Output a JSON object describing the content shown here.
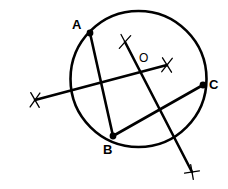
{
  "figure": {
    "kind": "circle-construction-diagram",
    "background_color": "#ffffff",
    "ink_color": "#000000",
    "width": 228,
    "height": 189
  },
  "circle": {
    "name": "main-circle",
    "cx": 138.5,
    "cy": 79,
    "r": 68,
    "stroke_width": 2.6
  },
  "points": [
    {
      "id": "A",
      "label": "A",
      "cx": 90,
      "cy": 33,
      "dot_r": 3.4,
      "label_x": 72,
      "label_y": 18
    },
    {
      "id": "B",
      "label": "B",
      "cx": 113,
      "cy": 136,
      "dot_r": 3.4,
      "label_x": 103,
      "label_y": 143
    },
    {
      "id": "C",
      "label": "C",
      "cx": 203,
      "cy": 85,
      "dot_r": 3.4,
      "label_x": 209,
      "label_y": 78
    }
  ],
  "center": {
    "id": "O",
    "label": "O",
    "label_x": 139,
    "label_y": 52
  },
  "chords": [
    {
      "name": "chord-ab",
      "from": "A",
      "to": "B",
      "x1": 90,
      "y1": 33,
      "x2": 113,
      "y2": 136,
      "stroke_width": 2.6
    },
    {
      "name": "chord-bc",
      "from": "B",
      "to": "C",
      "x1": 113,
      "y1": 136,
      "x2": 203,
      "y2": 85,
      "stroke_width": 2.6
    }
  ],
  "bisectors": [
    {
      "name": "perpendicular-bisector-of-bc",
      "x1": 35,
      "y1": 100,
      "x2": 167,
      "y2": 65,
      "stroke_width": 2.6
    },
    {
      "name": "perpendicular-bisector-of-ab",
      "x1": 125,
      "y1": 42,
      "x2": 192,
      "y2": 172,
      "stroke_width": 2.6
    }
  ],
  "arc_crosses": [
    {
      "name": "arc-cross-top",
      "cx": 125,
      "cy": 42,
      "a_angle": 62,
      "b_angle": 132,
      "len": 17,
      "stroke_width": 1.3
    },
    {
      "name": "arc-cross-right",
      "cx": 167,
      "cy": 65,
      "a_angle": 58,
      "b_angle": 128,
      "len": 17,
      "stroke_width": 1.3
    },
    {
      "name": "arc-cross-left",
      "cx": 35,
      "cy": 100,
      "a_angle": 60,
      "b_angle": 125,
      "len": 17,
      "stroke_width": 1.3
    },
    {
      "name": "arc-cross-bottom",
      "cx": 192,
      "cy": 172,
      "a_angle": 80,
      "b_angle": 172,
      "len": 15,
      "stroke_width": 1.3
    }
  ]
}
